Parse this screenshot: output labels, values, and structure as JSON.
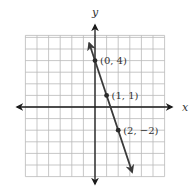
{
  "chart_data": {
    "type": "line",
    "title": "",
    "xlabel": "x",
    "ylabel": "y",
    "xlim": [
      -6,
      6
    ],
    "ylim": [
      -6,
      6
    ],
    "grid": true,
    "grid_step": 1,
    "line": {
      "slope": -3,
      "intercept": 4,
      "x_range": [
        -0.5,
        3.2
      ],
      "arrows_both_ends": true
    },
    "points": [
      {
        "x": 0,
        "y": 4,
        "label": "(0, 4)"
      },
      {
        "x": 1,
        "y": 1,
        "label": "(1, 1)"
      },
      {
        "x": 2,
        "y": -2,
        "label": "(2, −2)"
      }
    ],
    "colors": {
      "grid": "#b9b9b9",
      "axis": "#1a1a1a",
      "line": "#3a3a3a"
    }
  }
}
